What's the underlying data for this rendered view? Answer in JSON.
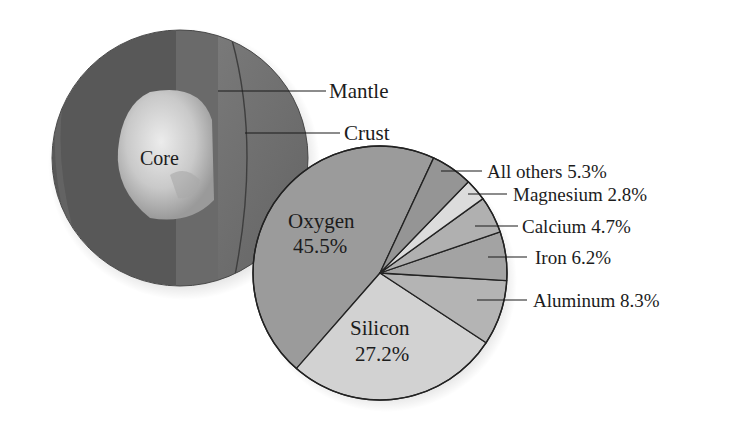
{
  "globe": {
    "labels": {
      "core": "Core",
      "mantle": "Mantle",
      "crust": "Crust"
    }
  },
  "pie": {
    "oxygen_name": "Oxygen",
    "oxygen_value": "45.5%",
    "silicon_name": "Silicon",
    "silicon_value": "27.2%",
    "others_label": "All others 5.3%",
    "magnesium_label": "Magnesium 2.8%",
    "calcium_label": "Calcium 4.7%",
    "iron_label": "Iron 6.2%",
    "aluminum_label": "Aluminum 8.3%"
  },
  "colors": {
    "oxygen": "#9b9b9b",
    "silicon": "#d2d2d2",
    "aluminum": "#b4b4b4",
    "iron": "#a3a3a3",
    "calcium": "#b0b0b0",
    "magnesium": "#dcdcdc",
    "others": "#959595",
    "globe_mantle": "#5a5a5a",
    "globe_core": "#c8c8c8"
  },
  "chart_data": {
    "type": "pie",
    "title": "",
    "categories": [
      "Oxygen",
      "Silicon",
      "Aluminum",
      "Iron",
      "Calcium",
      "Magnesium",
      "All others"
    ],
    "values": [
      45.5,
      27.2,
      8.3,
      6.2,
      4.7,
      2.8,
      5.3
    ],
    "unit": "%",
    "annotations": [
      "Core",
      "Mantle",
      "Crust"
    ],
    "legend": "none (direct labels with leader lines)"
  }
}
